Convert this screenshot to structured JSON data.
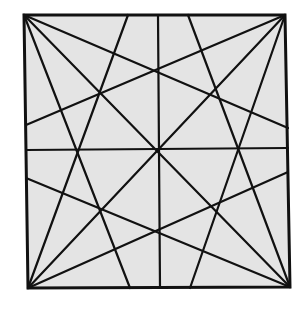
{
  "diagram": {
    "fill_color": "#e4e4e4",
    "stroke_color": "#111111",
    "square": {
      "tl": [
        24,
        15
      ],
      "tr": [
        285,
        15
      ],
      "br": [
        290,
        287
      ],
      "bl": [
        28,
        288
      ]
    },
    "lines": [
      [
        158,
        15,
        160,
        288
      ],
      [
        26,
        150,
        288,
        148
      ],
      [
        24,
        15,
        290,
        287
      ],
      [
        285,
        15,
        28,
        288
      ],
      [
        24,
        15,
        288,
        128
      ],
      [
        24,
        15,
        130,
        288
      ],
      [
        285,
        15,
        26,
        125
      ],
      [
        285,
        15,
        190,
        288
      ],
      [
        290,
        287,
        188,
        15
      ],
      [
        290,
        287,
        26,
        178
      ],
      [
        28,
        288,
        128,
        15
      ],
      [
        28,
        288,
        288,
        172
      ]
    ]
  }
}
